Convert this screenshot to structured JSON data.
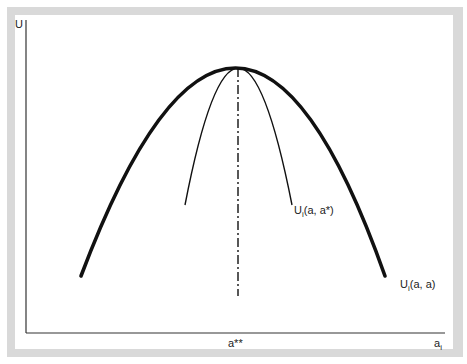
{
  "diagram": {
    "y_axis_label": "U",
    "x_axis_label": "a",
    "x_axis_label_sub": "i",
    "peak_label": "a**",
    "curves": [
      {
        "id": "outer",
        "label_main": "U",
        "label_sub": "i",
        "label_args": "(a, a)",
        "style": "thick"
      },
      {
        "id": "inner",
        "label_main": "U",
        "label_sub": "i",
        "label_args": "(a, a*)",
        "style": "thin"
      }
    ],
    "peak_marker": {
      "style": "dash-dot",
      "label": "a**"
    }
  },
  "colors": {
    "frame": "#d9d9d9",
    "ink": "#111111"
  }
}
